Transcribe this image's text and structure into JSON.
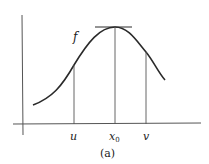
{
  "figure": {
    "caption": "(a)",
    "curve_label": "f",
    "x_labels": {
      "u": "u",
      "x0_base": "x",
      "x0_sub": "0",
      "v": "v"
    },
    "colors": {
      "line": "#2a2a2a",
      "axis": "#555555",
      "background": "#ffffff"
    }
  }
}
